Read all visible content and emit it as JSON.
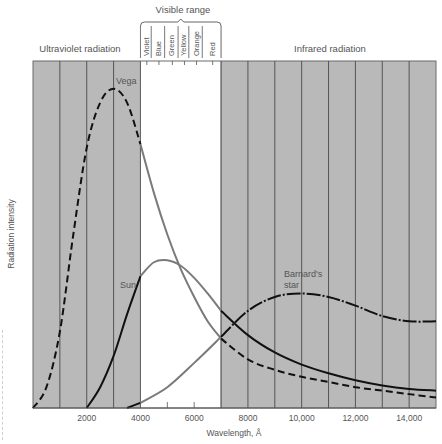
{
  "chart_data": {
    "type": "line",
    "title": "",
    "xlabel": "Wavelength, Å",
    "ylabel": "Radiation intensity",
    "xlim": [
      0,
      15000
    ],
    "ylim": [
      0,
      100
    ],
    "x_ticks": [
      2000,
      4000,
      6000,
      8000,
      10000,
      12000,
      14000
    ],
    "x_tick_labels": [
      "2000",
      "4000",
      "6000",
      "8000",
      "10,000",
      "12,000",
      "14,000"
    ],
    "minor_ticks_visible": [
      5000,
      6000
    ],
    "grid_vertical_every": 1000,
    "grid": true,
    "legend": "none (curves labeled inline)",
    "regions": [
      {
        "name": "Ultraviolet radiation",
        "from": 0,
        "to": 4000,
        "shaded": true
      },
      {
        "name": "Visible range",
        "from": 4000,
        "to": 7000,
        "shaded": false
      },
      {
        "name": "Infrared radiation",
        "from": 7000,
        "to": 15000,
        "shaded": true
      }
    ],
    "visible_bands": [
      {
        "name": "Violet",
        "from": 4000,
        "to": 4400
      },
      {
        "name": "Blue",
        "from": 4400,
        "to": 4900
      },
      {
        "name": "Green",
        "from": 4900,
        "to": 5400
      },
      {
        "name": "Yellow",
        "from": 5400,
        "to": 5800
      },
      {
        "name": "Orange",
        "from": 5800,
        "to": 6300
      },
      {
        "name": "Red",
        "from": 6300,
        "to": 7000
      }
    ],
    "series": [
      {
        "name": "Vega",
        "style": "dashed outside visible, solid grey in visible",
        "x": [
          0,
          500,
          1000,
          1500,
          2000,
          2500,
          3000,
          3500,
          4000,
          4500,
          5000,
          5500,
          6000,
          6500,
          7000,
          8000,
          9000,
          10000,
          11000,
          12000,
          13000,
          14000,
          15000
        ],
        "values": [
          0,
          6,
          22,
          50,
          75,
          88,
          92,
          88,
          76,
          62,
          50,
          40,
          32,
          25,
          20,
          14,
          11,
          9,
          7.5,
          6,
          5,
          4,
          3
        ]
      },
      {
        "name": "Sun",
        "style": "solid",
        "x": [
          2000,
          2500,
          3000,
          3500,
          4000,
          4500,
          5000,
          5500,
          6000,
          6500,
          7000,
          8000,
          9000,
          10000,
          11000,
          12000,
          13000,
          14000,
          15000
        ],
        "values": [
          0,
          6,
          15,
          27,
          38,
          42,
          42.6,
          41,
          37.5,
          33,
          28,
          21,
          16,
          12.5,
          10,
          8,
          6.5,
          5.5,
          5
        ]
      },
      {
        "name": "Barnard's star",
        "style": "dash-dot outside visible, solid grey in visible",
        "x": [
          3500,
          4000,
          5000,
          6000,
          7000,
          8000,
          9000,
          10000,
          11000,
          12000,
          13000,
          14000,
          15000
        ],
        "values": [
          0,
          1.5,
          6,
          13,
          20.5,
          28,
          32,
          33,
          32,
          29.5,
          26.5,
          25,
          25
        ]
      }
    ],
    "annotations": [
      {
        "text": "Vega",
        "x": 3000,
        "y": 96
      },
      {
        "text": "Sun",
        "x": 3300,
        "y": 43
      },
      {
        "text": "Barnard's star",
        "x": 8900,
        "y": 37
      },
      {
        "text": "Visible range",
        "x": 5500,
        "y": "above"
      },
      {
        "text": "Ultraviolet radiation",
        "x": 2000,
        "y": "above"
      },
      {
        "text": "Infrared radiation",
        "x": 11000,
        "y": "above"
      }
    ]
  },
  "labels": {
    "uv": "Ultraviolet radiation",
    "visible": "Visible range",
    "ir": "Infrared radiation",
    "xlabel": "Wavelength, Å",
    "ylabel": "Radiation intensity",
    "vega": "Vega",
    "sun": "Sun",
    "barnard_1": "Barnard's",
    "barnard_2": "star"
  },
  "colors": {
    "shade": "#b9b9b9",
    "grid": "#4a4a4a",
    "curve_dark": "#111111",
    "curve_grey": "#7a7a7a",
    "text": "#555555"
  }
}
